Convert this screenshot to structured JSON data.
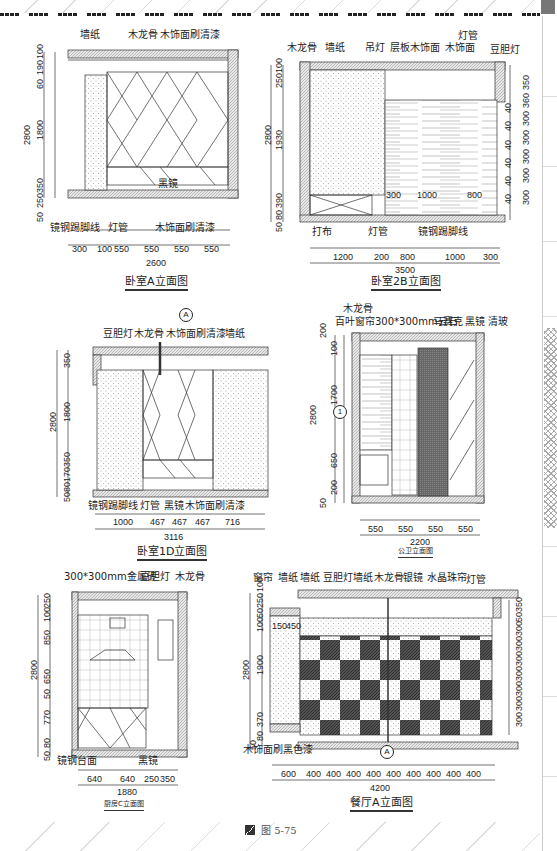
{
  "figure": {
    "caption": "图 5-75",
    "caption_icon": "figure-icon"
  },
  "drawings": {
    "bedroom_a": {
      "title": "卧室A立面图",
      "labels": [
        "墙纸",
        "木龙骨",
        "木饰面刷清漆",
        "黑镜",
        "镜钢踢脚线",
        "灯管",
        "木饰面刷清漆"
      ],
      "left_dims": [
        "100",
        "190",
        "60",
        "1800",
        "350",
        "250",
        "50"
      ],
      "total_height": "2800",
      "bottom_dims": [
        "300",
        "100",
        "550",
        "550",
        "550",
        "550"
      ],
      "total_width": "2600"
    },
    "bedroom_2b": {
      "title": "卧室2B立面图",
      "labels": [
        "木龙骨",
        "墙纸",
        "吊灯",
        "层板木饰面",
        "灯管",
        "木饰面",
        "豆胆灯",
        "打布",
        "灯管",
        "镜钢踢脚线"
      ],
      "left_dims": [
        "100",
        "250",
        "1930",
        "390",
        "80",
        "50"
      ],
      "total_height": "2800",
      "right_dims": [
        "350",
        "360",
        "300",
        "300",
        "300",
        "300",
        "300"
      ],
      "right_inner_dims": [
        "40",
        "40",
        "40",
        "40",
        "40",
        "40"
      ],
      "inner_dims": [
        "300",
        "1000",
        "800"
      ],
      "bottom_dims": [
        "1200",
        "200",
        "800",
        "1000",
        "300"
      ],
      "total_width": "3500"
    },
    "bedroom_1d": {
      "title": "卧室1D立面图",
      "section_marker": "A",
      "labels": [
        "豆胆灯",
        "木龙骨",
        "木饰面刷清漆",
        "墙纸",
        "镜钢踢脚线",
        "灯管",
        "黑镜",
        "木饰面刷清漆"
      ],
      "left_dims": [
        "350",
        "1800",
        "350",
        "170",
        "80",
        "50"
      ],
      "total_height": "2800",
      "bottom_dims": [
        "1000",
        "467",
        "467",
        "467",
        "716"
      ],
      "total_width": "3116"
    },
    "public_bath": {
      "title": "公卫立面图",
      "detail_marker": "1",
      "labels": [
        "木龙骨",
        "百叶窗帘",
        "300*300mm云石",
        "马赛克",
        "黑镜",
        "清玻"
      ],
      "left_dims": [
        "200",
        "100",
        "1700",
        "650",
        "200",
        "50"
      ],
      "total_height": "2800",
      "bottom_dims": [
        "550",
        "550",
        "550",
        "550"
      ],
      "total_width": "2200"
    },
    "kitchen_c": {
      "title": "厨房C立面图",
      "labels": [
        "300*300mm金属砖",
        "豆胆灯",
        "木龙骨",
        "镜钢台面",
        "黑镜"
      ],
      "left_dims": [
        "250",
        "100",
        "850",
        "650",
        "50",
        "770",
        "80",
        "50"
      ],
      "total_height": "2800",
      "bottom_dims": [
        "640",
        "640",
        "250",
        "350"
      ],
      "total_width": "1880"
    },
    "dining_a": {
      "title": "餐厅A立面图",
      "section_marker": "A",
      "labels": [
        "窗帘",
        "墙纸",
        "墙纸",
        "豆胆灯",
        "墙纸",
        "木龙骨",
        "银镜",
        "水晶珠帘",
        "灯管",
        "木饰面刷黑色漆"
      ],
      "left_dims": [
        "100",
        "250",
        "50",
        "100",
        "1900",
        "370",
        "80",
        "50"
      ],
      "total_height": "2800",
      "inner_dims": [
        "150",
        "450"
      ],
      "right_dims": [
        "350",
        "50",
        "300",
        "300",
        "300",
        "300",
        "300",
        "300",
        "300"
      ],
      "bottom_dims": [
        "600",
        "400",
        "400",
        "400",
        "400",
        "400",
        "400",
        "400",
        "400",
        "400"
      ],
      "total_width": "4200"
    }
  }
}
